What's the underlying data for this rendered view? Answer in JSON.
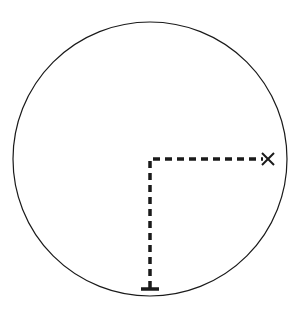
{
  "diagram": {
    "width": 298,
    "height": 310,
    "background": "#ffffff",
    "stroke_color": "#1a1a1a",
    "circle": {
      "cx": 150,
      "cy": 159,
      "r": 137,
      "stroke_width": 1.2
    },
    "path": {
      "description": "dashed L-shaped path from start marker up to circle center then right to X",
      "dash": "7,5",
      "stroke_width": 3.5,
      "points": [
        [
          150,
          288
        ],
        [
          150,
          159
        ],
        [
          263,
          159
        ]
      ]
    },
    "start_marker": {
      "shape": "bar",
      "x": 150,
      "y": 289,
      "width": 18
    },
    "end_marker": {
      "shape": "x",
      "x": 268,
      "y": 159,
      "size": 6
    }
  }
}
